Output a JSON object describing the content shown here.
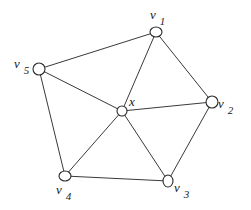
{
  "diagram": {
    "type": "graph",
    "colors": {
      "edge": "#3a3a3a",
      "node_stroke": "#2a2a2a",
      "node_fill": "#ffffff",
      "text": "#222222"
    },
    "nodes": [
      {
        "id": "v1",
        "cx": 156,
        "cy": 32,
        "rx": 6,
        "ry": 5
      },
      {
        "id": "v2",
        "cx": 212,
        "cy": 102,
        "rx": 6,
        "ry": 6
      },
      {
        "id": "v3",
        "cx": 168,
        "cy": 181,
        "rx": 5,
        "ry": 6
      },
      {
        "id": "v4",
        "cx": 65,
        "cy": 176,
        "rx": 6,
        "ry": 5
      },
      {
        "id": "v5",
        "cx": 39,
        "cy": 69,
        "rx": 6,
        "ry": 6
      },
      {
        "id": "x",
        "cx": 122,
        "cy": 111,
        "rx": 5,
        "ry": 5
      }
    ],
    "edges": [
      [
        "v1",
        "v2"
      ],
      [
        "v2",
        "v3"
      ],
      [
        "v3",
        "v4"
      ],
      [
        "v4",
        "v5"
      ],
      [
        "v5",
        "v1"
      ],
      [
        "x",
        "v1"
      ],
      [
        "x",
        "v2"
      ],
      [
        "x",
        "v3"
      ],
      [
        "x",
        "v4"
      ],
      [
        "x",
        "v5"
      ]
    ],
    "labels": {
      "v1": {
        "main": "v",
        "sub": "1",
        "left": 150,
        "top": 6,
        "sub_dy": 6
      },
      "v2": {
        "main": "v",
        "sub": "2",
        "left": 218,
        "top": 95,
        "sub_dy": 6
      },
      "v3": {
        "main": "v",
        "sub": "3",
        "left": 174,
        "top": 179,
        "sub_dy": 6
      },
      "v4": {
        "main": "v",
        "sub": "4",
        "left": 56,
        "top": 181,
        "sub_dy": 6
      },
      "v5": {
        "main": "v",
        "sub": "5",
        "left": 14,
        "top": 55,
        "sub_dy": 6
      },
      "x": {
        "main": "x",
        "sub": "",
        "left": 129,
        "top": 93,
        "sub_dy": 0
      }
    }
  }
}
